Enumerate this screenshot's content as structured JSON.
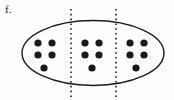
{
  "figure": {
    "label": "f.",
    "caption_text": "f.",
    "type": "set-partition-diagram",
    "total_dots": 15,
    "group_count": 3,
    "dots_per_group": 5,
    "colors": {
      "dot_fill": "#1a1a1a",
      "outline_stroke": "#1a1a1a",
      "divider_stroke": "#111111",
      "background": "#fefefe"
    },
    "ellipse": {
      "cx": 93,
      "cy": 53,
      "rx": 71,
      "ry": 32.5,
      "stroke_width": 1.4
    },
    "dividers": [
      {
        "x": 71,
        "y1": 9,
        "y2": 97,
        "dash": "1.6 3.2",
        "stroke_width": 1.5
      },
      {
        "x": 116,
        "y1": 9,
        "y2": 97,
        "dash": "1.6 3.2",
        "stroke_width": 1.5
      }
    ],
    "groups": [
      {
        "name": "left-group",
        "count": 5,
        "dots": [
          {
            "cx": 38,
            "cy": 43,
            "r": 3.6
          },
          {
            "cx": 52,
            "cy": 43,
            "r": 3.6
          },
          {
            "cx": 38,
            "cy": 55,
            "r": 3.6
          },
          {
            "cx": 52,
            "cy": 55,
            "r": 3.6
          },
          {
            "cx": 44,
            "cy": 68,
            "r": 3.6
          }
        ]
      },
      {
        "name": "middle-group",
        "count": 5,
        "dots": [
          {
            "cx": 85,
            "cy": 43,
            "r": 3.6
          },
          {
            "cx": 99,
            "cy": 43,
            "r": 3.6
          },
          {
            "cx": 85,
            "cy": 55,
            "r": 3.6
          },
          {
            "cx": 99,
            "cy": 55,
            "r": 3.6
          },
          {
            "cx": 92,
            "cy": 68,
            "r": 3.6
          }
        ]
      },
      {
        "name": "right-group",
        "count": 5,
        "dots": [
          {
            "cx": 130,
            "cy": 43,
            "r": 3.6
          },
          {
            "cx": 144,
            "cy": 43,
            "r": 3.6
          },
          {
            "cx": 130,
            "cy": 55,
            "r": 3.6
          },
          {
            "cx": 144,
            "cy": 55,
            "r": 3.6
          },
          {
            "cx": 136,
            "cy": 68,
            "r": 3.6
          }
        ]
      }
    ]
  }
}
